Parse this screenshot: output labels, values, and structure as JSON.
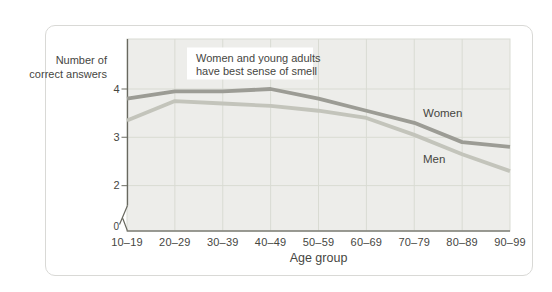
{
  "figure": {
    "ylabel_lines": [
      "Number of",
      "correct answers"
    ],
    "xlabel": "Age group",
    "annotation_lines": [
      "Women and young adults",
      "have best sense of smell"
    ]
  },
  "chart_data": {
    "type": "line",
    "title": "",
    "categories": [
      "10–19",
      "20–29",
      "30–39",
      "40–49",
      "50–59",
      "60–69",
      "70–79",
      "80–89",
      "90–99"
    ],
    "series": [
      {
        "name": "Women",
        "color": "#9c9c95",
        "values": [
          3.8,
          3.95,
          3.95,
          4.0,
          3.8,
          3.55,
          3.3,
          2.9,
          2.8
        ]
      },
      {
        "name": "Men",
        "color": "#c3c4bb",
        "values": [
          3.35,
          3.75,
          3.7,
          3.65,
          3.55,
          3.4,
          3.05,
          2.65,
          2.3
        ]
      }
    ],
    "xlabel": "Age group",
    "ylabel": "Number of correct answers",
    "yticks": [
      0,
      2,
      3,
      4
    ],
    "ylim": [
      0,
      5
    ],
    "axis_break_between": [
      0,
      2
    ],
    "grid": true,
    "legend_position": "inline-labels-right",
    "annotation": "Women and young adults have best sense of smell"
  },
  "colors": {
    "women_line": "#9c9c95",
    "men_line": "#c3c4bb",
    "plot_bg": "#ededea",
    "grid": "#d9dbd3",
    "axis": "#68685f",
    "text": "#46463f",
    "card_border": "#d9d9d6",
    "annotation_bg": "#ffffff"
  }
}
